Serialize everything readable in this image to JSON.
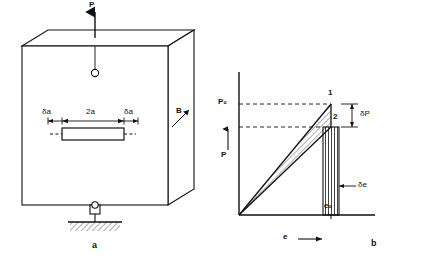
{
  "figure": {
    "panel_a": {
      "sublabel": "a",
      "load_label": "P",
      "thickness_label": "B",
      "crack_half_label": "2a",
      "left_increment_label": "δa",
      "right_increment_label": "δa"
    },
    "panel_b": {
      "sublabel": "b",
      "y_axis_label": "P",
      "x_axis_label": "e",
      "point_1": "1",
      "point_2": "2",
      "load_level": "P₀",
      "load_drop": "δP",
      "displacement": "e₀",
      "displacement_increment": "δe"
    }
  },
  "caption": {
    "text": ""
  },
  "colors": {
    "ink": "#111111",
    "paper": "#ffffff",
    "hatch": "#222222"
  }
}
